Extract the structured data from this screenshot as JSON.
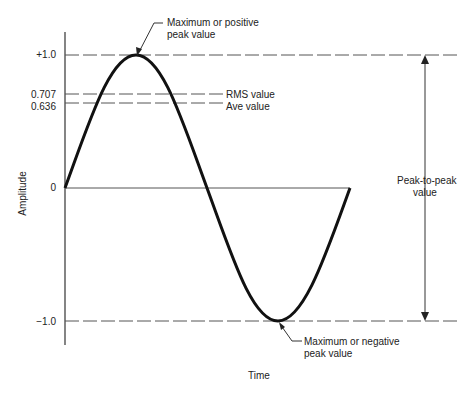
{
  "diagram": {
    "y_axis_label": "Amplitude",
    "x_axis_label": "Time",
    "ticks": [
      {
        "label": "+1.0",
        "value": 1.0
      },
      {
        "label": "0.707",
        "value": 0.707
      },
      {
        "label": "0.636",
        "value": 0.636
      },
      {
        "label": "0",
        "value": 0
      },
      {
        "label": "−1.0",
        "value": -1.0
      }
    ],
    "annotations": {
      "positive_peak": [
        "Maximum or positive",
        "peak value"
      ],
      "negative_peak": [
        "Maximum or negative",
        "peak value"
      ],
      "rms": "RMS value",
      "average": "Ave value",
      "peak_to_peak": [
        "Peak-to-peak",
        "value"
      ]
    },
    "colors": {
      "curve": "#111111",
      "lines": "#555555"
    }
  }
}
